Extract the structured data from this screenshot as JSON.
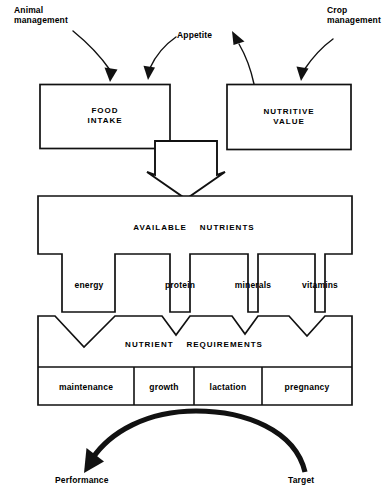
{
  "diagram": {
    "stroke_color": "#111111",
    "fill_color": "#ffffff",
    "background": "#ffffff",
    "annotations": {
      "animal_management": "Animal\nmanagement",
      "appetite": "Appetite",
      "crop_management": "Crop\nmanagement",
      "performance": "Performance",
      "target": "Target"
    },
    "boxes": {
      "food_intake": "FOOD\nINTAKE",
      "nutritive_value": "NUTRITIVE\nVALUE",
      "available_nutrients": "AVAILABLE    NUTRIENTS",
      "nutrient_requirements": "NUTRIENT    REQUIREMENTS"
    },
    "channels": [
      {
        "label": "energy"
      },
      {
        "label": "protein"
      },
      {
        "label": "minerals"
      },
      {
        "label": "vitamins"
      }
    ],
    "requirement_cells": [
      {
        "label": "maintenance"
      },
      {
        "label": "growth"
      },
      {
        "label": "lactation"
      },
      {
        "label": "pregnancy"
      }
    ]
  }
}
